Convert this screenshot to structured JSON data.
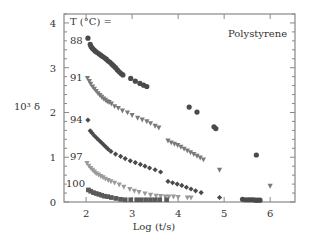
{
  "chart_data": {
    "type": "scatter",
    "title": "",
    "annotation": "Polystyrene",
    "legend_header": "T (°C) =",
    "xlabel": "Log (t/s)",
    "ylabel": "10³ δ",
    "xlim": [
      1.52,
      6.54
    ],
    "ylim": [
      0,
      4.2
    ],
    "xticks": [
      2,
      3,
      4,
      5,
      6
    ],
    "yticks": [
      0,
      1,
      2,
      3,
      4
    ],
    "grid": false,
    "series": [
      {
        "name": "88",
        "marker": "circle",
        "color": "#4a4a4a",
        "points": [
          [
            2.04,
            3.66
          ],
          [
            2.09,
            3.52
          ],
          [
            2.11,
            3.47
          ],
          [
            2.14,
            3.43
          ],
          [
            2.17,
            3.4
          ],
          [
            2.2,
            3.37
          ],
          [
            2.24,
            3.34
          ],
          [
            2.28,
            3.31
          ],
          [
            2.32,
            3.28
          ],
          [
            2.36,
            3.25
          ],
          [
            2.4,
            3.22
          ],
          [
            2.44,
            3.19
          ],
          [
            2.48,
            3.15
          ],
          [
            2.52,
            3.12
          ],
          [
            2.56,
            3.08
          ],
          [
            2.6,
            3.04
          ],
          [
            2.64,
            3.0
          ],
          [
            2.68,
            2.95
          ],
          [
            2.72,
            2.91
          ],
          [
            2.76,
            2.87
          ],
          [
            2.8,
            2.84
          ],
          [
            2.97,
            2.76
          ],
          [
            3.07,
            2.7
          ],
          [
            3.17,
            2.65
          ],
          [
            3.25,
            2.61
          ],
          [
            3.32,
            2.58
          ],
          [
            4.24,
            2.12
          ],
          [
            4.41,
            2.01
          ],
          [
            4.78,
            1.68
          ],
          [
            4.82,
            1.64
          ],
          [
            5.7,
            1.05
          ],
          [
            5.4,
            0.06
          ],
          [
            5.47,
            0.05
          ],
          [
            5.53,
            0.05
          ],
          [
            5.58,
            0.05
          ],
          [
            5.63,
            0.05
          ],
          [
            5.68,
            0.04
          ],
          [
            5.73,
            0.04
          ],
          [
            5.78,
            0.04
          ]
        ]
      },
      {
        "name": "91",
        "marker": "triangle-down",
        "color": "#7a7a7a",
        "points": [
          [
            2.03,
            2.77
          ],
          [
            2.07,
            2.7
          ],
          [
            2.1,
            2.64
          ],
          [
            2.14,
            2.58
          ],
          [
            2.18,
            2.53
          ],
          [
            2.22,
            2.48
          ],
          [
            2.26,
            2.43
          ],
          [
            2.3,
            2.39
          ],
          [
            2.34,
            2.35
          ],
          [
            2.38,
            2.31
          ],
          [
            2.42,
            2.28
          ],
          [
            2.46,
            2.25
          ],
          [
            2.5,
            2.23
          ],
          [
            2.55,
            2.2
          ],
          [
            2.62,
            2.14
          ],
          [
            2.7,
            2.1
          ],
          [
            2.79,
            2.04
          ],
          [
            2.9,
            2.0
          ],
          [
            3.0,
            1.94
          ],
          [
            3.12,
            1.88
          ],
          [
            3.22,
            1.84
          ],
          [
            3.32,
            1.8
          ],
          [
            3.4,
            1.76
          ],
          [
            3.5,
            1.7
          ],
          [
            3.58,
            1.66
          ],
          [
            3.78,
            1.37
          ],
          [
            3.85,
            1.33
          ],
          [
            3.92,
            1.3
          ],
          [
            3.99,
            1.27
          ],
          [
            4.06,
            1.23
          ],
          [
            4.13,
            1.19
          ],
          [
            4.2,
            1.15
          ],
          [
            4.27,
            1.11
          ],
          [
            4.34,
            1.07
          ],
          [
            4.41,
            1.03
          ],
          [
            4.48,
            0.99
          ],
          [
            4.55,
            0.95
          ],
          [
            4.9,
            0.72
          ],
          [
            6.0,
            0.36
          ]
        ]
      },
      {
        "name": "94",
        "marker": "diamond",
        "color": "#4a4a4a",
        "points": [
          [
            2.04,
            1.83
          ],
          [
            2.09,
            1.59
          ],
          [
            2.13,
            1.54
          ],
          [
            2.18,
            1.48
          ],
          [
            2.23,
            1.43
          ],
          [
            2.28,
            1.38
          ],
          [
            2.33,
            1.33
          ],
          [
            2.38,
            1.28
          ],
          [
            2.43,
            1.23
          ],
          [
            2.48,
            1.18
          ],
          [
            2.54,
            1.13
          ],
          [
            2.64,
            1.07
          ],
          [
            2.75,
            1.02
          ],
          [
            2.85,
            0.97
          ],
          [
            2.96,
            0.92
          ],
          [
            3.07,
            0.88
          ],
          [
            3.18,
            0.84
          ],
          [
            3.28,
            0.8
          ],
          [
            3.38,
            0.76
          ],
          [
            3.5,
            0.72
          ],
          [
            3.62,
            0.67
          ],
          [
            3.78,
            0.46
          ],
          [
            3.88,
            0.43
          ],
          [
            3.98,
            0.4
          ],
          [
            4.08,
            0.37
          ],
          [
            4.18,
            0.33
          ],
          [
            4.28,
            0.29
          ],
          [
            4.38,
            0.25
          ],
          [
            4.5,
            0.21
          ],
          [
            4.9,
            0.1
          ]
        ]
      },
      {
        "name": "97",
        "marker": "triangle-down",
        "color": "#9a9a9a",
        "points": [
          [
            2.02,
            0.87
          ],
          [
            2.06,
            0.81
          ],
          [
            2.1,
            0.76
          ],
          [
            2.14,
            0.72
          ],
          [
            2.18,
            0.68
          ],
          [
            2.22,
            0.64
          ],
          [
            2.27,
            0.61
          ],
          [
            2.32,
            0.58
          ],
          [
            2.37,
            0.55
          ],
          [
            2.42,
            0.52
          ],
          [
            2.48,
            0.49
          ],
          [
            2.54,
            0.46
          ],
          [
            2.62,
            0.43
          ],
          [
            2.72,
            0.39
          ],
          [
            2.82,
            0.34
          ],
          [
            2.95,
            0.29
          ],
          [
            3.05,
            0.25
          ],
          [
            3.15,
            0.22
          ],
          [
            3.28,
            0.19
          ],
          [
            3.4,
            0.16
          ],
          [
            3.52,
            0.14
          ],
          [
            3.62,
            0.13
          ],
          [
            3.72,
            0.12
          ],
          [
            3.8,
            0.12
          ],
          [
            3.9,
            0.12
          ],
          [
            4.0,
            0.11
          ],
          [
            4.2,
            0.1
          ],
          [
            4.28,
            0.1
          ]
        ]
      },
      {
        "name": "100",
        "marker": "square",
        "color": "#5a5a5a",
        "points": [
          [
            2.05,
            0.27
          ],
          [
            2.1,
            0.24
          ],
          [
            2.16,
            0.21
          ],
          [
            2.22,
            0.19
          ],
          [
            2.28,
            0.17
          ],
          [
            2.34,
            0.15
          ],
          [
            2.4,
            0.13
          ],
          [
            2.47,
            0.12
          ],
          [
            2.55,
            0.1
          ],
          [
            2.65,
            0.08
          ],
          [
            2.75,
            0.06
          ],
          [
            2.85,
            0.05
          ],
          [
            2.97,
            0.05
          ],
          [
            3.1,
            0.05
          ],
          [
            3.2,
            0.05
          ],
          [
            3.3,
            0.05
          ],
          [
            3.4,
            0.05
          ],
          [
            3.5,
            0.05
          ],
          [
            3.6,
            0.05
          ],
          [
            3.75,
            0.05
          ]
        ]
      }
    ]
  }
}
